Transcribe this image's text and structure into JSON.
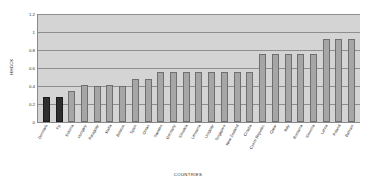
{
  "chart_data": {
    "type": "bar",
    "title": "",
    "xlabel": "COUNTRIES",
    "ylabel": "HHDCK",
    "ylim": [
      0,
      1.2
    ],
    "ytick_labels": [
      "1.2",
      "1",
      "0.8",
      "0.6",
      "0.4",
      "0.2",
      "0"
    ],
    "ytick_values": [
      1.2,
      1.0,
      0.8,
      0.6,
      0.4,
      0.2,
      0
    ],
    "grid": true,
    "legend": "none",
    "bar_color": "#a6a6a6",
    "highlight_color": "#2e2e2e",
    "plot_background": "#d4d4d4",
    "highlight_indices": [
      0,
      1
    ],
    "categories": [
      "Denmark",
      "Fiji",
      "Estonia",
      "Hungary",
      "Paraguay",
      "Malta",
      "Belarus",
      "Spain",
      "Oman",
      "Sweden",
      "Germany",
      "Slovakia",
      "Lithuania",
      "Uruguay",
      "Singapore",
      "New Zealand",
      "Croatia",
      "Czech Republic",
      "Qatar",
      "Italy",
      "Romania",
      "Slovenia",
      "Latvia",
      "Poland",
      "Bahrain"
    ],
    "values": [
      0.28,
      0.28,
      0.34,
      0.41,
      0.4,
      0.41,
      0.4,
      0.48,
      0.48,
      0.56,
      0.56,
      0.56,
      0.56,
      0.56,
      0.56,
      0.56,
      0.56,
      0.76,
      0.76,
      0.76,
      0.76,
      0.76,
      0.92,
      0.92,
      0.92
    ]
  }
}
